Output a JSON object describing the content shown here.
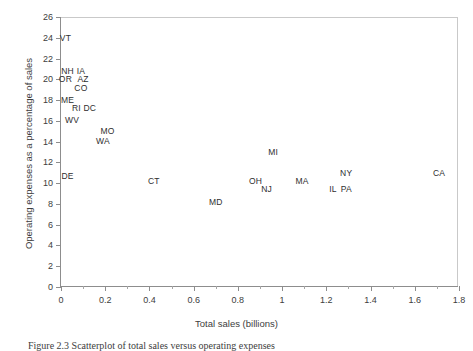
{
  "chart_data": {
    "type": "scatter",
    "title": "",
    "xlabel": "Total sales (billions)",
    "ylabel": "Operating expenses as a percentage of sales",
    "xlim": [
      0,
      1.8
    ],
    "ylim": [
      0,
      26
    ],
    "xticks": [
      0,
      0.2,
      0.4,
      0.6,
      0.8,
      1,
      1.2,
      1.4,
      1.6,
      1.8
    ],
    "xtick_labels": [
      "0",
      "0.2",
      "0.4",
      "0.6",
      "0.8",
      "1",
      "1.2",
      "1.4",
      "1.6",
      "1.8"
    ],
    "xminor_step": 0.1,
    "yticks": [
      0,
      2,
      4,
      6,
      8,
      10,
      12,
      14,
      16,
      18,
      20,
      22,
      24,
      26
    ],
    "ytick_labels": [
      "0",
      "2",
      "4",
      "6",
      "8",
      "10",
      "12",
      "14",
      "16",
      "18",
      "20",
      "22",
      "24",
      "26"
    ],
    "grid": false,
    "legend": null,
    "marker_style": "text-label",
    "points": [
      {
        "label": "VT",
        "x": 0.02,
        "y": 24.0
      },
      {
        "label": "NH",
        "x": 0.03,
        "y": 20.8
      },
      {
        "label": "IA",
        "x": 0.09,
        "y": 20.8
      },
      {
        "label": "OR",
        "x": 0.02,
        "y": 20.0
      },
      {
        "label": "AZ",
        "x": 0.1,
        "y": 20.0
      },
      {
        "label": "CO",
        "x": 0.09,
        "y": 19.2
      },
      {
        "label": "ME",
        "x": 0.03,
        "y": 18.0
      },
      {
        "label": "RI",
        "x": 0.07,
        "y": 17.2
      },
      {
        "label": "DC",
        "x": 0.13,
        "y": 17.2
      },
      {
        "label": "WV",
        "x": 0.05,
        "y": 16.1
      },
      {
        "label": "MO",
        "x": 0.21,
        "y": 15.0
      },
      {
        "label": "WA",
        "x": 0.19,
        "y": 14.1
      },
      {
        "label": "MI",
        "x": 0.96,
        "y": 13.0
      },
      {
        "label": "DE",
        "x": 0.03,
        "y": 10.7
      },
      {
        "label": "CT",
        "x": 0.42,
        "y": 10.2
      },
      {
        "label": "OH",
        "x": 0.88,
        "y": 10.2
      },
      {
        "label": "MA",
        "x": 1.09,
        "y": 10.2
      },
      {
        "label": "NY",
        "x": 1.29,
        "y": 11.0
      },
      {
        "label": "CA",
        "x": 1.71,
        "y": 11.0
      },
      {
        "label": "NJ",
        "x": 0.93,
        "y": 9.4
      },
      {
        "label": "IL",
        "x": 1.23,
        "y": 9.4
      },
      {
        "label": "PA",
        "x": 1.29,
        "y": 9.4
      },
      {
        "label": "MD",
        "x": 0.7,
        "y": 8.2
      }
    ]
  },
  "caption": {
    "text": "Figure 2.3  Scatterplot of total sales versus operating expenses"
  }
}
